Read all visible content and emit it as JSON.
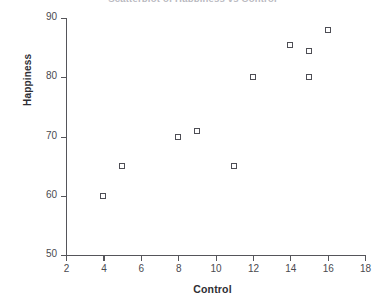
{
  "chart_data": {
    "type": "scatter",
    "title": "Scatterplot of Happiness vs Control",
    "xlabel": "Control",
    "ylabel": "Happiness",
    "xlim": [
      2,
      18
    ],
    "ylim": [
      50,
      90
    ],
    "xticks": [
      2,
      4,
      6,
      8,
      10,
      12,
      14,
      16,
      18
    ],
    "yticks": [
      50,
      60,
      70,
      80,
      90
    ],
    "grid": false,
    "legend": null,
    "marker": "open-square",
    "marker_color": "#4e4e55",
    "points": [
      {
        "x": 4,
        "y": 60
      },
      {
        "x": 5,
        "y": 65
      },
      {
        "x": 8,
        "y": 70
      },
      {
        "x": 9,
        "y": 71
      },
      {
        "x": 11,
        "y": 65
      },
      {
        "x": 12,
        "y": 80
      },
      {
        "x": 14,
        "y": 85.5
      },
      {
        "x": 15,
        "y": 84.5
      },
      {
        "x": 15,
        "y": 80
      },
      {
        "x": 16,
        "y": 88
      }
    ]
  }
}
